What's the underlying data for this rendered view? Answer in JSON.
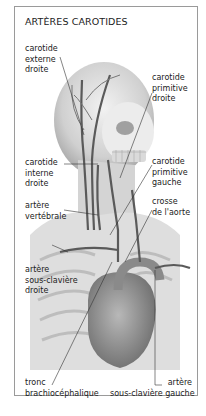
{
  "figure": {
    "title": "ARTÈRES CAROTIDES",
    "labels": [
      {
        "id": "carotide-externe-droite",
        "lines": [
          "carotide",
          "externe",
          "droite"
        ]
      },
      {
        "id": "carotide-primitive-droite",
        "lines": [
          "carotide",
          "primitive",
          "droite"
        ]
      },
      {
        "id": "carotide-interne-droite",
        "lines": [
          "carotide",
          "interne",
          "droite"
        ]
      },
      {
        "id": "carotide-primitive-gauche",
        "lines": [
          "carotide",
          "primitive",
          "gauche"
        ]
      },
      {
        "id": "artere-vertebrale",
        "lines": [
          "artère",
          "vertébrale"
        ]
      },
      {
        "id": "crosse-de-l-aorte",
        "lines": [
          "crosse",
          "de l'aorte"
        ]
      },
      {
        "id": "artere-sous-claviere-droite",
        "lines": [
          "artère",
          "sous-clavière",
          "droite"
        ]
      },
      {
        "id": "tronc-brachiocephalique",
        "lines": [
          "tronc",
          "brachiocéphalique"
        ]
      },
      {
        "id": "artere-sous-claviere-gauche",
        "lines": [
          "artère",
          "sous-clavière gauche"
        ]
      }
    ],
    "colors": {
      "frame": "#9a9a9a",
      "body": "#d9d9d9",
      "shade": "#b5b5b5",
      "artery": "#5a5a5a",
      "heart": "#8c8c8c",
      "leader": "#333333"
    }
  }
}
